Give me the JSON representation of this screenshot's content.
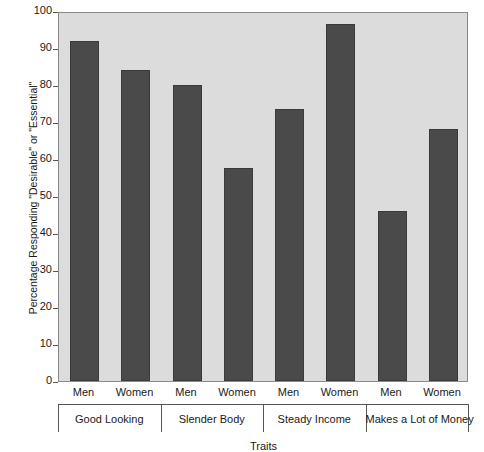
{
  "chart_data": {
    "type": "bar",
    "title": "",
    "xlabel": "Traits",
    "ylabel": "Percentage Responding \"Desirable\" or \"Essential\"",
    "ylim": [
      0,
      100
    ],
    "ytick_labels": [
      "100",
      "90",
      "80",
      "70",
      "60",
      "50",
      "40",
      "30",
      "20",
      "10",
      "0"
    ],
    "ytick_values": [
      100,
      90,
      80,
      70,
      60,
      50,
      40,
      30,
      20,
      10,
      0
    ],
    "grid": false,
    "legend": "none",
    "categories": [
      "Good Looking",
      "Slender Body",
      "Steady Income",
      "Makes a Lot of Money"
    ],
    "subcategories": [
      "Men",
      "Women"
    ],
    "series": [
      {
        "name": "Men",
        "values": [
          92,
          80,
          73.5,
          46
        ]
      },
      {
        "name": "Women",
        "values": [
          84,
          57.5,
          96.5,
          68
        ]
      }
    ],
    "bars": [
      {
        "group": "Good Looking",
        "gender": "Men",
        "value": 92
      },
      {
        "group": "Good Looking",
        "gender": "Women",
        "value": 84
      },
      {
        "group": "Slender Body",
        "gender": "Men",
        "value": 80
      },
      {
        "group": "Slender Body",
        "gender": "Women",
        "value": 57.5
      },
      {
        "group": "Steady Income",
        "gender": "Men",
        "value": 73.5
      },
      {
        "group": "Steady Income",
        "gender": "Women",
        "value": 96.5
      },
      {
        "group": "Makes a Lot of Money",
        "gender": "Men",
        "value": 46
      },
      {
        "group": "Makes a Lot of Money",
        "gender": "Women",
        "value": 68
      }
    ],
    "colors": {
      "bar": "#4a4a4a",
      "plot_background": "#dcdcdc",
      "figure_background": "#ffffff",
      "axis": "#555555",
      "text": "#1a1a1a"
    }
  }
}
